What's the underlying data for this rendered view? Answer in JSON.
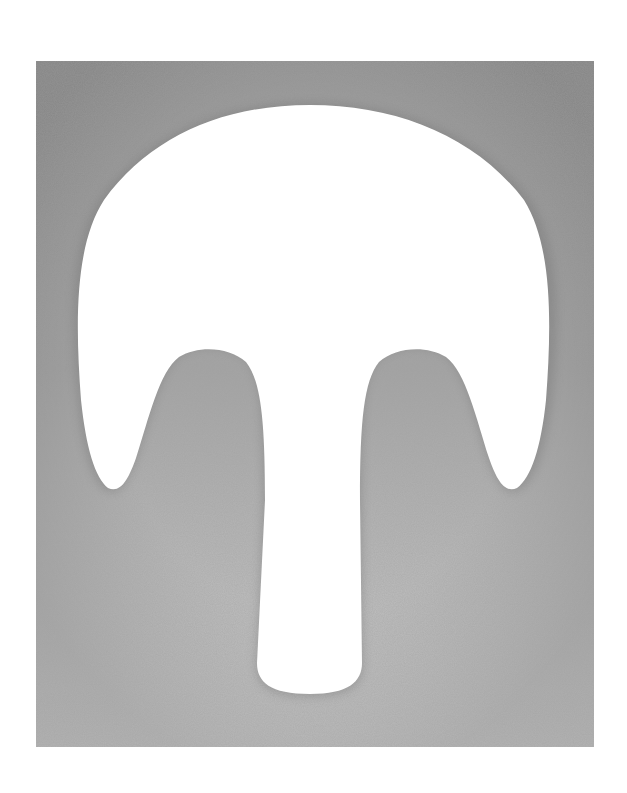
{
  "artwork": {
    "subject": "white mushroom-shaped silhouette on gray stippled ground",
    "colors": {
      "page": "#ffffff",
      "field_dark": "#8f8f8f",
      "field_mid": "#a9a9a9",
      "field_light": "#c8c8c8",
      "shape": "#ffffff"
    },
    "field": {
      "x": 36,
      "y": 61,
      "width": 558,
      "height": 686
    }
  }
}
